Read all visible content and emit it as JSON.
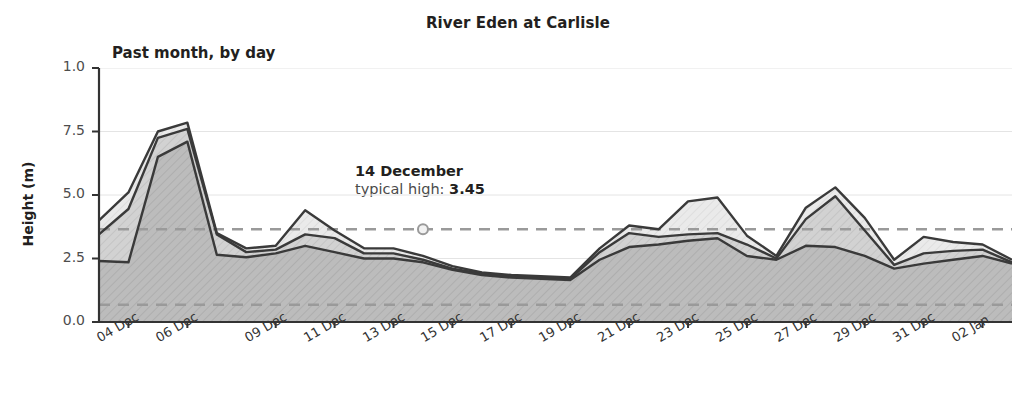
{
  "chart_data": {
    "type": "area",
    "title": "River Eden at Carlisle",
    "subtitle": "Past month, by day",
    "xlabel": "",
    "ylabel": "Height (m)",
    "ylim": [
      0.0,
      10.0
    ],
    "yticks": [
      0.0,
      2.5,
      5.0,
      7.5,
      10.0
    ],
    "ytick_labels": [
      "0.0",
      "2.5",
      "5.0",
      "7.5",
      "1.0"
    ],
    "grid": true,
    "legend_position": "none",
    "x": [
      "03 Dec",
      "04 Dec",
      "05 Dec",
      "06 Dec",
      "07 Dec",
      "08 Dec",
      "09 Dec",
      "10 Dec",
      "11 Dec",
      "12 Dec",
      "13 Dec",
      "14 Dec",
      "15 Dec",
      "16 Dec",
      "17 Dec",
      "18 Dec",
      "19 Dec",
      "20 Dec",
      "21 Dec",
      "22 Dec",
      "23 Dec",
      "24 Dec",
      "25 Dec",
      "26 Dec",
      "27 Dec",
      "28 Dec",
      "29 Dec",
      "30 Dec",
      "31 Dec",
      "01 Jan",
      "02 Jan",
      "03 Jan"
    ],
    "xtick_labels": [
      "04 Dec",
      "06 Dec",
      "09 Dec",
      "11 Dec",
      "13 Dec",
      "15 Dec",
      "17 Dec",
      "19 Dec",
      "21 Dec",
      "23 Dec",
      "25 Dec",
      "27 Dec",
      "29 Dec",
      "31 Dec",
      "02 Jan"
    ],
    "series": [
      {
        "name": "max",
        "values": [
          4.0,
          5.1,
          7.5,
          7.85,
          3.5,
          2.9,
          3.0,
          4.4,
          3.6,
          2.9,
          2.9,
          2.6,
          2.2,
          1.95,
          1.85,
          1.8,
          1.75,
          2.9,
          3.8,
          3.65,
          4.75,
          4.9,
          3.4,
          2.6,
          4.5,
          5.3,
          4.1,
          2.45,
          3.35,
          3.15,
          3.05,
          2.45
        ]
      },
      {
        "name": "mid",
        "values": [
          3.45,
          4.45,
          7.25,
          7.6,
          3.45,
          2.75,
          2.85,
          3.45,
          3.3,
          2.7,
          2.7,
          2.45,
          2.1,
          1.9,
          1.8,
          1.75,
          1.7,
          2.75,
          3.5,
          3.35,
          3.45,
          3.5,
          3.05,
          2.5,
          4.05,
          4.95,
          3.6,
          2.25,
          2.7,
          2.8,
          2.85,
          2.35
        ]
      },
      {
        "name": "min",
        "values": [
          2.4,
          2.35,
          6.5,
          7.1,
          2.65,
          2.55,
          2.7,
          3.0,
          2.75,
          2.5,
          2.5,
          2.35,
          2.05,
          1.85,
          1.75,
          1.7,
          1.65,
          2.45,
          2.95,
          3.05,
          3.2,
          3.3,
          2.6,
          2.45,
          3.0,
          2.95,
          2.6,
          2.1,
          2.3,
          2.45,
          2.6,
          2.3
        ]
      }
    ],
    "reference_lines": [
      {
        "name": "typical-high",
        "value": 3.65,
        "style": "dashed"
      },
      {
        "name": "typical-low",
        "value": 0.68,
        "style": "dashed"
      }
    ],
    "annotation": {
      "date": "14 December",
      "label_prefix": "typical high: ",
      "value": "3.45",
      "marker_x": "14 Dec",
      "marker_y": 3.65
    },
    "colors": {
      "band_max_fill": "#e9e9e9",
      "band_mid_fill": "#cfcfcf",
      "band_min_fill": "#b5b5b5",
      "line": "#3a3a3a",
      "reference_line": "#9a9a9a",
      "grid": "#e4e4e4",
      "axis": "#333333",
      "text": "#231f20"
    }
  }
}
